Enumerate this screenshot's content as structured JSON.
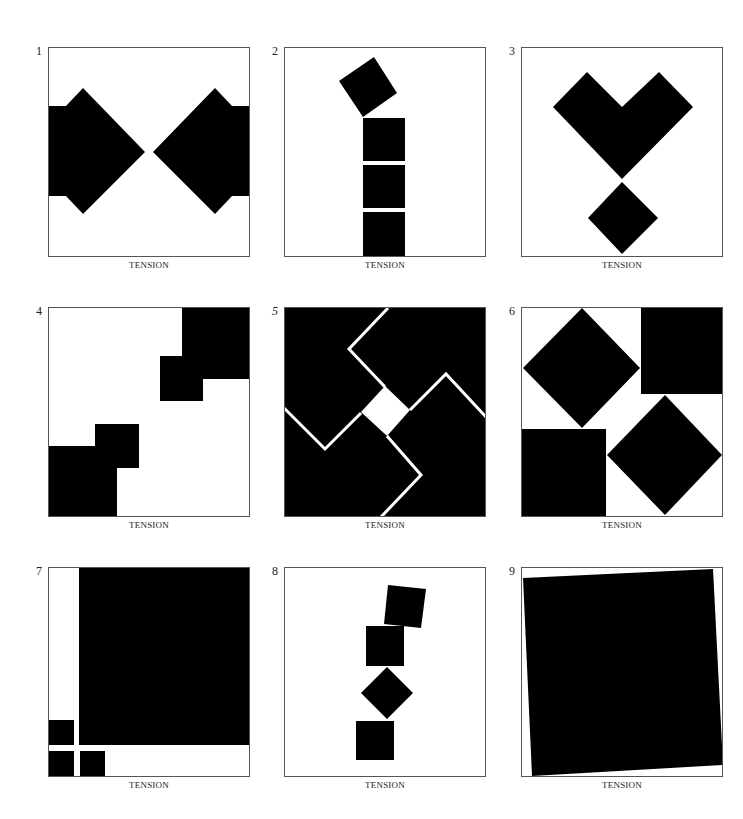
{
  "figure": {
    "panels": [
      {
        "number": "1",
        "caption": "TENSION"
      },
      {
        "number": "2",
        "caption": "TENSION"
      },
      {
        "number": "3",
        "caption": "TENSION"
      },
      {
        "number": "4",
        "caption": "TENSION"
      },
      {
        "number": "5",
        "caption": "TENSION"
      },
      {
        "number": "6",
        "caption": "TENSION"
      },
      {
        "number": "7",
        "caption": "TENSION"
      },
      {
        "number": "8",
        "caption": "TENSION"
      },
      {
        "number": "9",
        "caption": "TENSION"
      }
    ],
    "colors": {
      "shape_fill": "#000000",
      "background": "#ffffff",
      "frame_border": "#555555"
    }
  }
}
